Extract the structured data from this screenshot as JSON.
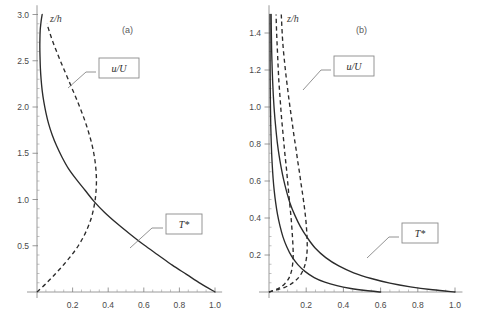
{
  "figure": {
    "panels": [
      {
        "id": "a",
        "panel_label": "(a)",
        "yaxis_title": "z/h",
        "curve_labels": {
          "dashed": "u/U",
          "solid": "T*"
        }
      },
      {
        "id": "b",
        "panel_label": "(b)",
        "yaxis_title": "z/h",
        "curve_labels": {
          "dashed": "u/U",
          "solid": "T*"
        }
      }
    ]
  },
  "chart_data": [
    {
      "type": "line",
      "title": "(a)",
      "xlabel": "",
      "ylabel": "z/h",
      "xlim": [
        0,
        1.04
      ],
      "ylim": [
        0,
        3.1
      ],
      "grid": false,
      "legend": "inline-boxed-callouts",
      "xticks": [
        0.2,
        0.4,
        0.6,
        0.8,
        1.0
      ],
      "xtick_labels": [
        "0.2",
        "0.4",
        "0.6",
        "0.8",
        "1.0"
      ],
      "yticks": [
        0.5,
        1.0,
        1.5,
        2.0,
        2.5,
        3.0
      ],
      "ytick_labels": [
        "0.5",
        "1.0",
        "1.5",
        "2.0",
        "2.5",
        "3.0"
      ],
      "series": [
        {
          "name": "T*",
          "style": "solid",
          "x": [
            1.0,
            0.92,
            0.84,
            0.76,
            0.68,
            0.6,
            0.52,
            0.45,
            0.38,
            0.32,
            0.27,
            0.22,
            0.175,
            0.14,
            0.11,
            0.085,
            0.065,
            0.05,
            0.038,
            0.029,
            0.023,
            0.019,
            0.017,
            0.016,
            0.0165,
            0.018,
            0.0215,
            0.0255,
            0.029
          ],
          "y": [
            0.0,
            0.09,
            0.19,
            0.29,
            0.4,
            0.51,
            0.63,
            0.74,
            0.86,
            0.98,
            1.1,
            1.22,
            1.34,
            1.46,
            1.58,
            1.7,
            1.82,
            1.94,
            2.06,
            2.18,
            2.3,
            2.42,
            2.54,
            2.64,
            2.74,
            2.83,
            2.9,
            2.96,
            3.0
          ]
        },
        {
          "name": "u/U",
          "style": "dashed",
          "x": [
            0.0,
            0.055,
            0.105,
            0.152,
            0.195,
            0.232,
            0.262,
            0.286,
            0.305,
            0.318,
            0.327,
            0.332,
            0.334,
            0.332,
            0.327,
            0.319,
            0.308,
            0.294,
            0.278,
            0.26,
            0.24,
            0.219,
            0.197,
            0.175,
            0.153,
            0.131,
            0.11,
            0.09,
            0.072,
            0.056
          ],
          "y": [
            0.0,
            0.1,
            0.2,
            0.3,
            0.4,
            0.5,
            0.6,
            0.7,
            0.8,
            0.9,
            1.0,
            1.1,
            1.2,
            1.3,
            1.4,
            1.5,
            1.6,
            1.7,
            1.8,
            1.9,
            2.0,
            2.1,
            2.2,
            2.3,
            2.4,
            2.5,
            2.6,
            2.7,
            2.8,
            2.9
          ]
        }
      ]
    },
    {
      "type": "line",
      "title": "(b)",
      "xlabel": "",
      "ylabel": "z/h",
      "xlim": [
        0,
        1.04
      ],
      "ylim": [
        0,
        1.55
      ],
      "grid": false,
      "legend": "inline-boxed-callouts",
      "xticks": [
        0.2,
        0.4,
        0.6,
        0.8,
        1.0
      ],
      "xtick_labels": [
        "0.2",
        "0.4",
        "0.6",
        "0.8",
        "1.0"
      ],
      "yticks": [
        0.2,
        0.4,
        0.6,
        0.8,
        1.0,
        1.2,
        1.4
      ],
      "ytick_labels": [
        "0.2",
        "0.4",
        "0.6",
        "0.8",
        "1.0",
        "1.2",
        "1.4"
      ],
      "series": [
        {
          "name": "T* (outer)",
          "style": "solid",
          "x": [
            1.0,
            0.88,
            0.76,
            0.65,
            0.55,
            0.455,
            0.375,
            0.305,
            0.248,
            0.205,
            0.168,
            0.138,
            0.113,
            0.094,
            0.078,
            0.065,
            0.054,
            0.045,
            0.038,
            0.032,
            0.027,
            0.023,
            0.02,
            0.0175,
            0.0155,
            0.014,
            0.013,
            0.0122,
            0.0118,
            0.0115
          ],
          "y": [
            0.0,
            0.012,
            0.028,
            0.048,
            0.073,
            0.104,
            0.141,
            0.186,
            0.238,
            0.295,
            0.355,
            0.417,
            0.48,
            0.545,
            0.61,
            0.675,
            0.74,
            0.805,
            0.87,
            0.935,
            1.0,
            1.065,
            1.13,
            1.195,
            1.26,
            1.32,
            1.38,
            1.43,
            1.47,
            1.5
          ]
        },
        {
          "name": "T* (inner)",
          "style": "solid",
          "x": [
            0.6,
            0.52,
            0.44,
            0.365,
            0.3,
            0.243,
            0.195,
            0.155,
            0.122,
            0.096,
            0.075,
            0.059,
            0.046,
            0.036,
            0.028,
            0.022,
            0.0175,
            0.014,
            0.0115,
            0.0095,
            0.0082,
            0.0072,
            0.0065,
            0.006,
            0.0057,
            0.0055
          ],
          "y": [
            0.0,
            0.008,
            0.019,
            0.034,
            0.053,
            0.078,
            0.11,
            0.148,
            0.192,
            0.243,
            0.298,
            0.357,
            0.418,
            0.482,
            0.548,
            0.615,
            0.685,
            0.755,
            0.828,
            0.9,
            0.98,
            1.06,
            1.14,
            1.25,
            1.38,
            1.5
          ]
        },
        {
          "name": "u/U (outer)",
          "style": "dashed",
          "x": [
            0.0,
            0.085,
            0.135,
            0.168,
            0.188,
            0.2,
            0.205,
            0.205,
            0.202,
            0.197,
            0.19,
            0.182,
            0.173,
            0.164,
            0.154,
            0.145,
            0.135,
            0.126,
            0.117,
            0.108,
            0.1,
            0.092,
            0.085,
            0.078,
            0.072,
            0.066
          ],
          "y": [
            0.0,
            0.025,
            0.055,
            0.09,
            0.13,
            0.175,
            0.225,
            0.28,
            0.34,
            0.4,
            0.46,
            0.52,
            0.58,
            0.645,
            0.71,
            0.775,
            0.84,
            0.905,
            0.97,
            1.035,
            1.1,
            1.165,
            1.23,
            1.3,
            1.38,
            1.5
          ]
        },
        {
          "name": "u/U (inner)",
          "style": "dashed",
          "x": [
            0.0,
            0.052,
            0.085,
            0.107,
            0.12,
            0.127,
            0.13,
            0.129,
            0.126,
            0.122,
            0.117,
            0.111,
            0.105,
            0.099,
            0.093,
            0.086,
            0.08,
            0.074,
            0.068,
            0.063,
            0.058,
            0.053,
            0.049,
            0.045,
            0.041,
            0.038
          ],
          "y": [
            0.0,
            0.02,
            0.045,
            0.075,
            0.11,
            0.15,
            0.195,
            0.245,
            0.3,
            0.36,
            0.42,
            0.48,
            0.545,
            0.61,
            0.675,
            0.74,
            0.805,
            0.87,
            0.935,
            1.0,
            1.07,
            1.14,
            1.22,
            1.31,
            1.4,
            1.5
          ]
        }
      ]
    }
  ]
}
